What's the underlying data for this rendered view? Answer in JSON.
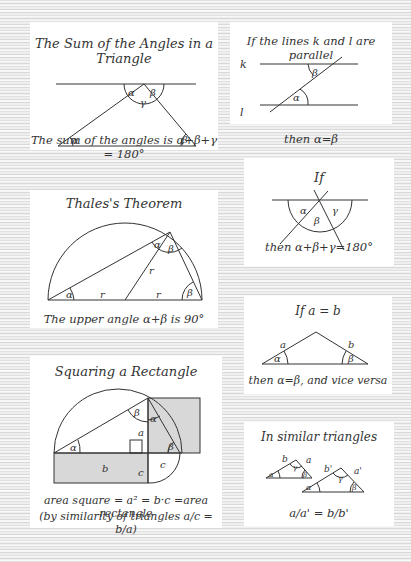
{
  "panels": {
    "sum_angles": {
      "title": "The Sum of the Angles in a Triangle",
      "caption": "The sum of the angles is α+β+γ = 180°",
      "labels": {
        "alpha_top": "α",
        "beta_top": "β",
        "gamma": "γ",
        "alpha_bottom": "α",
        "beta_bottom": "β"
      }
    },
    "parallel": {
      "title": "If the lines k and l are parallel",
      "caption": "then α=β",
      "labels": {
        "k": "k",
        "l": "l",
        "beta": "β",
        "alpha": "α"
      }
    },
    "thales": {
      "title": "Thales's Theorem",
      "caption": "The upper angle α+β is 90°",
      "labels": {
        "alpha_top": "α",
        "beta_top": "β",
        "r_center": "r",
        "r_left": "r",
        "r_right": "r",
        "alpha_bottom": "α",
        "beta_bottom": "β"
      }
    },
    "straight_angle": {
      "title": "If",
      "caption": "then α+β+γ=180°",
      "labels": {
        "alpha": "α",
        "beta": "β",
        "gamma": "γ"
      }
    },
    "isosceles": {
      "title": "If a = b",
      "caption": "then α=β, and vice versa",
      "labels": {
        "a": "a",
        "b": "b",
        "alpha": "α",
        "beta": "β"
      }
    },
    "squaring": {
      "title": "Squaring a Rectangle",
      "caption_line1": "area square = a² = b·c =area rectangle",
      "caption_line2": "(by similarity of triangles a/c = b/a)",
      "labels": {
        "alpha_left": "α",
        "beta_top": "β",
        "alpha_top": "α",
        "a": "a",
        "beta_right": "β",
        "b": "b",
        "c_rect": "c",
        "c_base": "c"
      }
    },
    "similar": {
      "title": "In similar triangles",
      "caption": "a/a' = b/b'",
      "labels": {
        "small": {
          "b": "b",
          "gamma": "γ",
          "a": "a",
          "alpha": "α",
          "beta": "β"
        },
        "large": {
          "b": "b'",
          "gamma": "γ",
          "a": "a'",
          "alpha": "α",
          "beta": "β"
        }
      }
    }
  },
  "colors": {
    "background": "#eeeeee",
    "panel": "#ffffff",
    "ink": "#333333",
    "shade": "#cfcfcf"
  }
}
